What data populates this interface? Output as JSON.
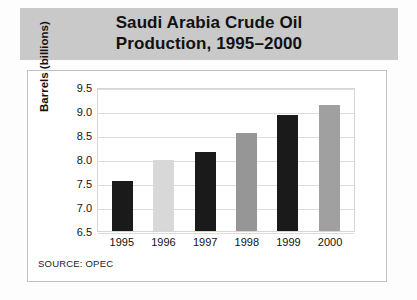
{
  "chart_data": {
    "type": "bar",
    "title": "Saudi Arabia Crude Oil\nProduction, 1995–2000",
    "xlabel": "",
    "ylabel": "Barrels (billions)",
    "categories": [
      "1995",
      "1996",
      "1997",
      "1998",
      "1999",
      "2000"
    ],
    "values": [
      7.55,
      7.97,
      8.15,
      8.55,
      8.92,
      9.12
    ],
    "ylim": [
      6.5,
      9.5
    ],
    "ytick_labels": [
      "9.5",
      "9.0",
      "8.5",
      "8.0",
      "7.5",
      "7.0",
      "6.5"
    ],
    "ytick_values": [
      9.5,
      9.0,
      8.5,
      8.0,
      7.5,
      7.0,
      6.5
    ],
    "bar_colors": [
      "#1a1a1a",
      "#d8d8d8",
      "#1a1a1a",
      "#969696",
      "#1a1a1a",
      "#a0a0a0"
    ],
    "grid": true,
    "legend": "none",
    "source_note": "SOURCE: OPEC",
    "title_band_color": "#c9c9c9",
    "gridline_color": "#dcdcdc",
    "plot_border_color": "#d6d6d6"
  }
}
